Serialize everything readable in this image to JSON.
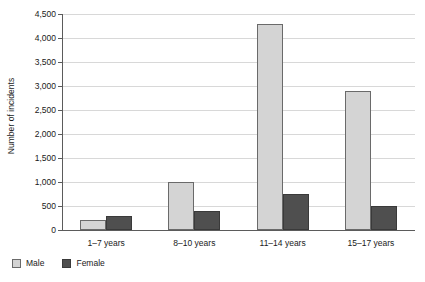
{
  "chart_data": {
    "type": "bar",
    "title": "",
    "xlabel": "",
    "ylabel": "Number of incidents",
    "categories": [
      "1–7 years",
      "8–10 years",
      "11–14 years",
      "15–17 years"
    ],
    "series": [
      {
        "name": "Male",
        "color": "#d4d4d4",
        "values": [
          200,
          1000,
          4300,
          2900
        ]
      },
      {
        "name": "Female",
        "color": "#4f4f4f",
        "values": [
          290,
          400,
          750,
          500
        ]
      }
    ],
    "ylim": [
      0,
      4500
    ],
    "ytick_values": [
      0,
      500,
      1000,
      1500,
      2000,
      2500,
      3000,
      3500,
      4000,
      4500
    ],
    "ytick_labels": [
      "0",
      "500",
      "1,000",
      "1,500",
      "2,000",
      "2,500",
      "3,000",
      "3,500",
      "4,000",
      "4,500"
    ],
    "grid": true,
    "grid_axis": "y",
    "legend_position": "bottom-left",
    "legend_entries": [
      "Male",
      "Female"
    ],
    "gridline_color": "#d8d8d8",
    "axis_color": "#5b5b5b",
    "background_color": "#ffffff"
  }
}
